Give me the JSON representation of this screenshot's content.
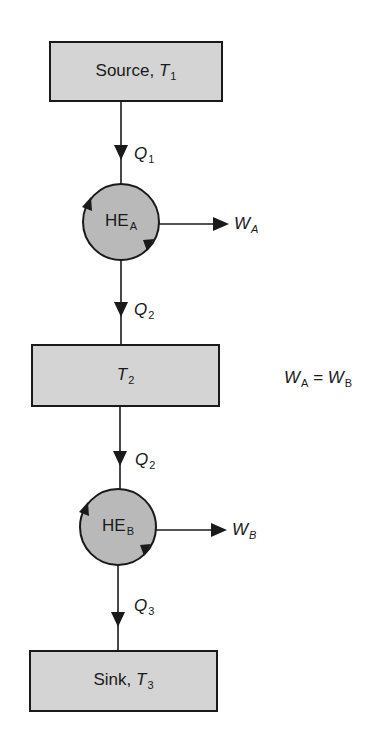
{
  "diagram": {
    "colors": {
      "box_fill": "#d4d4d4",
      "circle_fill": "#b9b9b9",
      "stroke": "#1a1a1a",
      "background": "#ffffff"
    },
    "reservoirs": [
      {
        "id": "source",
        "name": "Source,",
        "symbol": "T",
        "subscript": "1"
      },
      {
        "id": "middle",
        "name": "",
        "symbol": "T",
        "subscript": "2"
      },
      {
        "id": "sink",
        "name": "Sink,",
        "symbol": "T",
        "subscript": "3"
      }
    ],
    "engines": [
      {
        "id": "HE_A",
        "name": "HE",
        "subscript": "A",
        "work_symbol": "W",
        "work_subscript": "A"
      },
      {
        "id": "HE_B",
        "name": "HE",
        "subscript": "B",
        "work_symbol": "W",
        "work_subscript": "B"
      }
    ],
    "heat_flows": [
      {
        "from": "source",
        "to": "HE_A",
        "symbol": "Q",
        "subscript": "1"
      },
      {
        "from": "HE_A",
        "to": "middle",
        "symbol": "Q",
        "subscript": "2"
      },
      {
        "from": "middle",
        "to": "HE_B",
        "symbol": "Q",
        "subscript": "2"
      },
      {
        "from": "HE_B",
        "to": "sink",
        "symbol": "Q",
        "subscript": "3"
      }
    ],
    "condition": {
      "lhs_symbol": "W",
      "lhs_subscript": "A",
      "operator": "=",
      "rhs_symbol": "W",
      "rhs_subscript": "B"
    }
  }
}
